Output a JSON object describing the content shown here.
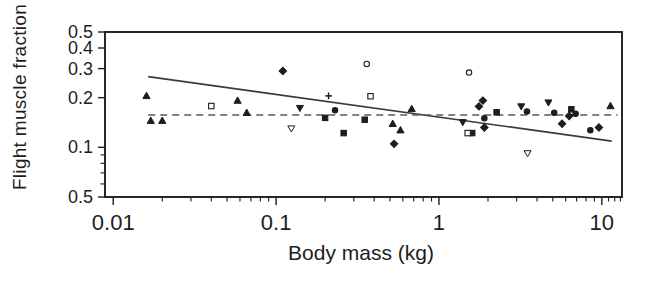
{
  "figure": {
    "kind": "scanned-journal-figure",
    "background": "#ffffff"
  },
  "chart_data": {
    "type": "scatter",
    "title": "",
    "xlabel": "Body mass (kg)",
    "ylabel": "Flight muscle fraction",
    "x_scale": "log",
    "y_scale": "log",
    "xlim": [
      0.0089,
      13.3
    ],
    "ylim": [
      0.05,
      0.5
    ],
    "grid": false,
    "legend": "none",
    "colors": {
      "ink": "#1d1d1d",
      "line": "#3a3a3a",
      "dash": "#5a5a5a",
      "open_fill": "#ffffff"
    },
    "x_ticks": [
      {
        "v": 0.01,
        "label": "0.01"
      },
      {
        "v": 0.1,
        "label": "0.1"
      },
      {
        "v": 1,
        "label": "1"
      },
      {
        "v": 10,
        "label": "10"
      }
    ],
    "x_minor_ticks": [
      0.02,
      0.03,
      0.04,
      0.05,
      0.06,
      0.07,
      0.08,
      0.09,
      0.2,
      0.3,
      0.4,
      0.5,
      0.6,
      0.7,
      0.8,
      0.9,
      2,
      3,
      4,
      5,
      6,
      7,
      8,
      9,
      11,
      12,
      13
    ],
    "y_ticks": [
      {
        "v": 0.5,
        "label": "0.5"
      },
      {
        "v": 0.4,
        "label": "0.4"
      },
      {
        "v": 0.3,
        "label": "0.3"
      },
      {
        "v": 0.2,
        "label": "0.2"
      },
      {
        "v": 0.1,
        "label": "0.1"
      },
      {
        "v": 0.05,
        "label": "0.5"
      }
    ],
    "y_minor_ticks": [
      0.09,
      0.08,
      0.07,
      0.06
    ],
    "lines": [
      {
        "name": "regression-line",
        "style": "solid",
        "x1": 0.0164,
        "y1": 0.268,
        "x2": 11.5,
        "y2": 0.109
      },
      {
        "name": "mean-dashed-line",
        "style": "dashed",
        "x1": 0.0164,
        "y1": 0.157,
        "x2": 12.5,
        "y2": 0.157
      }
    ],
    "series": [
      {
        "name": "triangle-up-filled",
        "marker": "triangle-up",
        "fill": "filled",
        "points": [
          [
            0.016,
            0.205
          ],
          [
            0.017,
            0.145
          ],
          [
            0.02,
            0.145
          ],
          [
            0.058,
            0.192
          ],
          [
            0.066,
            0.162
          ],
          [
            0.52,
            0.139
          ],
          [
            0.58,
            0.127
          ],
          [
            0.68,
            0.171
          ],
          [
            11.3,
            0.178
          ]
        ]
      },
      {
        "name": "triangle-down-filled",
        "marker": "triangle-down",
        "fill": "filled",
        "points": [
          [
            0.14,
            0.173
          ],
          [
            1.4,
            0.142
          ],
          [
            3.2,
            0.177
          ],
          [
            4.7,
            0.187
          ]
        ]
      },
      {
        "name": "triangle-down-open",
        "marker": "triangle-down",
        "fill": "open",
        "points": [
          [
            0.124,
            0.13
          ],
          [
            3.5,
            0.092
          ]
        ]
      },
      {
        "name": "square-filled",
        "marker": "square",
        "fill": "filled",
        "points": [
          [
            0.2,
            0.151
          ],
          [
            0.26,
            0.122
          ],
          [
            0.35,
            0.147
          ],
          [
            1.6,
            0.122
          ],
          [
            2.26,
            0.163
          ],
          [
            6.5,
            0.17
          ]
        ]
      },
      {
        "name": "square-open",
        "marker": "square",
        "fill": "open",
        "points": [
          [
            0.04,
            0.178
          ],
          [
            0.38,
            0.204
          ],
          [
            1.5,
            0.122
          ]
        ]
      },
      {
        "name": "circle-open",
        "marker": "circle",
        "fill": "open",
        "points": [
          [
            0.36,
            0.32
          ],
          [
            1.53,
            0.284
          ]
        ]
      },
      {
        "name": "circle-filled",
        "marker": "circle",
        "fill": "filled",
        "points": [
          [
            0.23,
            0.168
          ],
          [
            1.9,
            0.15
          ],
          [
            3.47,
            0.165
          ],
          [
            5.1,
            0.162
          ],
          [
            6.9,
            0.16
          ],
          [
            8.5,
            0.127
          ]
        ]
      },
      {
        "name": "diamond-filled",
        "marker": "diamond",
        "fill": "filled",
        "points": [
          [
            0.11,
            0.29
          ],
          [
            0.53,
            0.105
          ],
          [
            1.76,
            0.177
          ],
          [
            1.86,
            0.192
          ],
          [
            1.9,
            0.132
          ],
          [
            5.7,
            0.139
          ],
          [
            6.3,
            0.155
          ],
          [
            9.6,
            0.132
          ]
        ]
      },
      {
        "name": "plus",
        "marker": "plus",
        "fill": "open",
        "points": [
          [
            0.21,
            0.205
          ]
        ]
      }
    ]
  }
}
